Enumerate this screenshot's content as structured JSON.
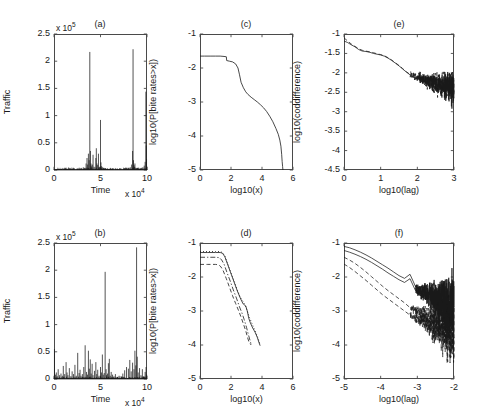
{
  "figure": {
    "name": "six-panel-network-traffic-figure",
    "background": "#ffffff",
    "axis_color": "#4a4a4a",
    "line_color": "#1a1a1a"
  },
  "chart_data": [
    {
      "id": "a",
      "type": "line",
      "title": "(a)",
      "xlabel": "Time",
      "ylabel": "Traffic",
      "x_multiplier": "x 10",
      "x_multiplier_exp": "4",
      "y_multiplier": "x 10",
      "y_multiplier_exp": "5",
      "xlim": [
        0,
        10
      ],
      "ylim": [
        0,
        2.5
      ],
      "xticks": [
        0,
        5,
        10
      ],
      "yticks": [
        0,
        0.5,
        1,
        1.5,
        2,
        2.5
      ],
      "xticklabels": [
        "0",
        "5",
        "10"
      ],
      "yticklabels": [
        "0",
        "0.5",
        "1",
        "1.5",
        "2",
        "2.5"
      ],
      "grid": false,
      "legend": "none",
      "series": [
        {
          "name": "traffic-bursty",
          "style": "solid",
          "x": [
            0.05,
            0.12,
            0.3,
            0.55,
            0.8,
            1.1,
            1.4,
            1.8,
            2.1,
            2.5,
            2.9,
            3.15,
            3.3,
            3.45,
            3.55,
            3.62,
            3.7,
            3.78,
            3.85,
            3.92,
            3.97,
            4.0,
            4.05,
            4.12,
            4.2,
            4.3,
            4.4,
            4.5,
            4.55,
            4.62,
            4.7,
            4.78,
            4.85,
            4.92,
            5.0,
            5.05,
            5.12,
            5.2,
            5.3,
            5.45,
            5.6,
            5.8,
            6.0,
            6.3,
            6.6,
            6.9,
            7.2,
            7.5,
            7.8,
            8.0,
            8.2,
            8.35,
            8.45,
            8.5,
            8.55,
            8.6,
            8.65,
            8.7,
            8.8,
            8.9,
            9.0,
            9.2,
            9.4,
            9.55,
            9.7,
            9.8,
            9.88,
            9.92,
            9.95,
            9.98
          ],
          "y": [
            0.02,
            0.01,
            0.015,
            0.02,
            0.01,
            0.015,
            0.02,
            0.01,
            0.015,
            0.02,
            0.03,
            0.05,
            0.04,
            0.12,
            0.22,
            0.1,
            0.3,
            0.18,
            2.17,
            0.35,
            0.12,
            0.08,
            0.05,
            0.1,
            0.28,
            0.06,
            0.05,
            0.22,
            0.4,
            0.12,
            0.09,
            0.3,
            0.05,
            0.06,
            0.92,
            0.14,
            0.07,
            0.05,
            0.04,
            0.03,
            0.02,
            0.015,
            0.02,
            0.03,
            0.02,
            0.015,
            0.03,
            0.02,
            0.04,
            0.03,
            0.05,
            0.1,
            0.35,
            2.22,
            0.18,
            0.09,
            0.06,
            0.12,
            0.04,
            0.03,
            0.02,
            0.02,
            0.03,
            0.05,
            0.08,
            0.15,
            1.44,
            0.45,
            0.2,
            0.06
          ]
        }
      ]
    },
    {
      "id": "b",
      "type": "line",
      "title": "(b)",
      "xlabel": "Time",
      "ylabel": "Traffic",
      "x_multiplier": "x 10",
      "x_multiplier_exp": "4",
      "y_multiplier": "x 10",
      "y_multiplier_exp": "5",
      "xlim": [
        0,
        10
      ],
      "ylim": [
        0,
        2.5
      ],
      "xticks": [
        0,
        5,
        10
      ],
      "yticks": [
        0,
        0.5,
        1,
        1.5,
        2,
        2.5
      ],
      "xticklabels": [
        "0",
        "5",
        "10"
      ],
      "yticklabels": [
        "0",
        "0.5",
        "1",
        "1.5",
        "2",
        "2.5"
      ],
      "grid": false,
      "legend": "none",
      "series": [
        {
          "name": "traffic-distributed",
          "style": "solid",
          "x": [
            0.05,
            0.15,
            0.25,
            0.35,
            0.45,
            0.6,
            0.75,
            0.9,
            1.0,
            1.15,
            1.3,
            1.4,
            1.5,
            1.65,
            1.8,
            1.95,
            2.1,
            2.25,
            2.4,
            2.55,
            2.7,
            2.8,
            2.9,
            3.05,
            3.2,
            3.35,
            3.5,
            3.6,
            3.7,
            3.8,
            3.9,
            4.0,
            4.1,
            4.2,
            4.35,
            4.5,
            4.6,
            4.7,
            4.85,
            5.0,
            5.1,
            5.2,
            5.3,
            5.4,
            5.5,
            5.6,
            5.65,
            5.75,
            5.85,
            5.95,
            6.05,
            6.15,
            6.3,
            6.45,
            6.6,
            6.8,
            7.0,
            7.2,
            7.4,
            7.6,
            7.8,
            8.0,
            8.15,
            8.3,
            8.45,
            8.6,
            8.7,
            8.8,
            8.88,
            8.95,
            9.05,
            9.2,
            9.35,
            9.5,
            9.65,
            9.8,
            9.9,
            9.96
          ],
          "y": [
            0.55,
            0.08,
            0.12,
            0.05,
            0.18,
            0.07,
            0.1,
            0.06,
            0.24,
            0.09,
            0.31,
            0.12,
            0.07,
            0.2,
            0.05,
            0.14,
            0.09,
            0.26,
            0.06,
            0.48,
            0.11,
            0.17,
            0.06,
            0.09,
            0.22,
            0.62,
            0.13,
            0.08,
            0.52,
            0.19,
            0.36,
            0.1,
            0.28,
            0.07,
            0.15,
            0.31,
            0.09,
            0.17,
            0.06,
            0.22,
            0.12,
            0.45,
            0.08,
            0.11,
            1.97,
            0.18,
            0.07,
            0.1,
            0.29,
            0.37,
            0.06,
            0.13,
            0.08,
            0.05,
            0.09,
            0.04,
            0.06,
            0.05,
            0.1,
            0.16,
            0.22,
            0.19,
            0.35,
            0.14,
            0.3,
            0.18,
            0.52,
            0.25,
            2.42,
            0.41,
            0.12,
            0.2,
            0.07,
            0.18,
            0.05,
            0.13,
            0.22,
            0.08
          ]
        }
      ]
    },
    {
      "id": "c",
      "type": "line",
      "title": "(c)",
      "xlabel": "log10(x)",
      "ylabel": "log10(P[bite rates>x])",
      "xlim": [
        0,
        6
      ],
      "ylim": [
        -5,
        -1
      ],
      "xticks": [
        0,
        2,
        4,
        6
      ],
      "yticks": [
        -5,
        -4,
        -3,
        -2,
        -1
      ],
      "xticklabels": [
        "0",
        "2",
        "4",
        "6"
      ],
      "yticklabels": [
        "-5",
        "-4",
        "-3",
        "-2",
        "-1"
      ],
      "grid": false,
      "legend": "none",
      "series": [
        {
          "name": "ccdf-aggregate",
          "style": "solid",
          "x": [
            0,
            0.3,
            0.7,
            1.0,
            1.3,
            1.55,
            1.7,
            1.72,
            1.9,
            2.1,
            2.3,
            2.45,
            2.55,
            2.65,
            2.8,
            2.95,
            3.1,
            3.3,
            3.5,
            3.7,
            3.9,
            4.1,
            4.3,
            4.5,
            4.7,
            4.9,
            5.05,
            5.15,
            5.22,
            5.27,
            5.3,
            5.33,
            5.35
          ],
          "y": [
            -1.65,
            -1.65,
            -1.65,
            -1.65,
            -1.65,
            -1.66,
            -1.67,
            -1.78,
            -1.8,
            -1.82,
            -1.88,
            -2.0,
            -2.2,
            -2.42,
            -2.58,
            -2.7,
            -2.78,
            -2.86,
            -2.93,
            -3.0,
            -3.08,
            -3.17,
            -3.28,
            -3.42,
            -3.58,
            -3.78,
            -3.95,
            -4.12,
            -4.3,
            -4.55,
            -4.75,
            -4.9,
            -5.0
          ]
        }
      ]
    },
    {
      "id": "d",
      "type": "line",
      "title": "(d)",
      "xlabel": "log10(x)",
      "ylabel": "log10(P[bite rates>x])",
      "xlim": [
        0,
        6
      ],
      "ylim": [
        -5,
        -1
      ],
      "xticks": [
        0,
        2,
        4,
        6
      ],
      "yticks": [
        -5,
        -4,
        -3,
        -2,
        -1
      ],
      "xticklabels": [
        "0",
        "2",
        "4",
        "6"
      ],
      "yticklabels": [
        "-5",
        "-4",
        "-3",
        "-2",
        "-1"
      ],
      "grid": false,
      "legend": "none",
      "series": [
        {
          "name": "ccdf-solid",
          "style": "solid",
          "x": [
            0,
            0.5,
            1.0,
            1.3,
            1.45,
            1.6,
            1.8,
            2.0,
            2.2,
            2.4,
            2.6,
            2.7,
            2.8,
            2.95,
            3.05,
            3.15,
            3.25,
            3.4,
            3.55,
            3.7,
            3.8,
            3.88
          ],
          "y": [
            -1.28,
            -1.28,
            -1.28,
            -1.28,
            -1.3,
            -1.4,
            -1.65,
            -1.9,
            -2.15,
            -2.4,
            -2.62,
            -2.72,
            -2.8,
            -2.85,
            -3.0,
            -3.22,
            -3.35,
            -3.5,
            -3.62,
            -3.78,
            -3.92,
            -4.02
          ]
        },
        {
          "name": "ccdf-dotted",
          "style": "dotted",
          "x": [
            0,
            0.5,
            1.0,
            1.3,
            1.45,
            1.6,
            1.8,
            2.0,
            2.2,
            2.4,
            2.6,
            2.75,
            2.9,
            3.05,
            3.2,
            3.4,
            3.55,
            3.7,
            3.85
          ],
          "y": [
            -1.25,
            -1.25,
            -1.25,
            -1.25,
            -1.28,
            -1.38,
            -1.62,
            -1.88,
            -2.12,
            -2.38,
            -2.6,
            -2.7,
            -2.82,
            -3.0,
            -3.2,
            -3.42,
            -3.58,
            -3.75,
            -3.95
          ]
        },
        {
          "name": "ccdf-dashdot",
          "style": "dashdot",
          "x": [
            0,
            0.5,
            1.0,
            1.25,
            1.4,
            1.55,
            1.75,
            1.95,
            2.15,
            2.35,
            2.55,
            2.7,
            2.85,
            3.0,
            3.1,
            3.2,
            3.3
          ],
          "y": [
            -1.42,
            -1.42,
            -1.42,
            -1.43,
            -1.5,
            -1.62,
            -1.88,
            -2.12,
            -2.38,
            -2.62,
            -2.88,
            -3.05,
            -3.25,
            -3.48,
            -3.66,
            -3.82,
            -3.98
          ]
        },
        {
          "name": "ccdf-dashed",
          "style": "dashed",
          "x": [
            0,
            0.5,
            1.0,
            1.2,
            1.35,
            1.5,
            1.7,
            1.9,
            2.1,
            2.3,
            2.5,
            2.65,
            2.8,
            2.95,
            3.05,
            3.15,
            3.3
          ],
          "y": [
            -1.63,
            -1.63,
            -1.63,
            -1.64,
            -1.7,
            -1.82,
            -2.05,
            -2.3,
            -2.55,
            -2.78,
            -3.0,
            -3.18,
            -3.38,
            -3.58,
            -3.75,
            -3.9,
            -4.0
          ]
        }
      ]
    },
    {
      "id": "e",
      "type": "line",
      "title": "(e)",
      "xlabel": "log10(lag)",
      "ylabel": "log10(coddifference)",
      "xlim": [
        0,
        3
      ],
      "ylim": [
        -4.5,
        -1
      ],
      "xticks": [
        0,
        1,
        2,
        3
      ],
      "yticks": [
        -4.5,
        -4,
        -3.5,
        -3,
        -2.5,
        -2,
        -1.5,
        -1
      ],
      "xticklabels": [
        "0",
        "1",
        "2",
        "3"
      ],
      "yticklabels": [
        "-4.5",
        "-4",
        "-3.5",
        "-3",
        "-2.5",
        "-2",
        "-1.5",
        "-1"
      ],
      "grid": false,
      "legend": "none",
      "series": [
        {
          "name": "coddiff-solid",
          "style": "solid",
          "noise_start_x": 1.75,
          "x": [
            0,
            0.1,
            0.2,
            0.3,
            0.4,
            0.5,
            0.6,
            0.7,
            0.8,
            0.9,
            1.0,
            1.1,
            1.2,
            1.3,
            1.4,
            1.5,
            1.6,
            1.7,
            1.8,
            1.9,
            2.0
          ],
          "y": [
            -1.18,
            -1.22,
            -1.28,
            -1.33,
            -1.4,
            -1.44,
            -1.45,
            -1.47,
            -1.5,
            -1.52,
            -1.54,
            -1.57,
            -1.62,
            -1.68,
            -1.75,
            -1.82,
            -1.9,
            -1.98,
            -2.05,
            -2.1,
            -2.12
          ]
        },
        {
          "name": "coddiff-dashed",
          "style": "dashed",
          "x": [
            0,
            0.1,
            0.2,
            0.3,
            0.4,
            0.5,
            0.6,
            0.7,
            0.8,
            0.9,
            1.0,
            1.1,
            1.2,
            1.3,
            1.4,
            1.5,
            1.6,
            1.7,
            1.8
          ],
          "y": [
            -1.1,
            -1.18,
            -1.26,
            -1.32,
            -1.38,
            -1.42,
            -1.44,
            -1.46,
            -1.48,
            -1.51,
            -1.53,
            -1.56,
            -1.61,
            -1.67,
            -1.74,
            -1.81,
            -1.89,
            -1.97,
            -2.04
          ]
        }
      ]
    },
    {
      "id": "f",
      "type": "line",
      "title": "(f)",
      "xlabel": "log10(lag)",
      "ylabel": "log10(coddifference)",
      "xlim": [
        0,
        3
      ],
      "ylim": [
        -5,
        -1
      ],
      "xticks": [
        0,
        1,
        2,
        3
      ],
      "yticks": [
        -5,
        -4,
        -3,
        -2,
        -1
      ],
      "xticklabels": [
        "-5",
        "-4",
        "-3",
        "-2",
        "-1"
      ],
      "yticklabels": [
        "-5",
        "-4",
        "-3",
        "-2",
        "-1"
      ],
      "grid": false,
      "legend": "none",
      "series": [
        {
          "name": "coddiff-solid-1",
          "style": "solid",
          "x": [
            0,
            0.15,
            0.3,
            0.45,
            0.6,
            0.75,
            0.9,
            1.05,
            1.2,
            1.35,
            1.5,
            1.65,
            1.8,
            1.95
          ],
          "y": [
            -1.1,
            -1.14,
            -1.2,
            -1.27,
            -1.35,
            -1.44,
            -1.54,
            -1.64,
            -1.74,
            -1.85,
            -1.96,
            -2.04,
            -1.92,
            -2.28
          ]
        },
        {
          "name": "coddiff-solid-2",
          "style": "solid",
          "x": [
            0,
            0.15,
            0.3,
            0.45,
            0.6,
            0.75,
            0.9,
            1.05,
            1.2,
            1.35,
            1.5,
            1.65,
            1.8,
            1.95
          ],
          "y": [
            -1.22,
            -1.27,
            -1.33,
            -1.4,
            -1.48,
            -1.57,
            -1.67,
            -1.77,
            -1.88,
            -1.98,
            -2.08,
            -2.16,
            -2.05,
            -2.4
          ]
        },
        {
          "name": "coddiff-dashed-1",
          "style": "dashed",
          "x": [
            0,
            0.15,
            0.3,
            0.45,
            0.6,
            0.75,
            0.9,
            1.05,
            1.2,
            1.35,
            1.5,
            1.65,
            1.8
          ],
          "y": [
            -1.42,
            -1.5,
            -1.6,
            -1.72,
            -1.85,
            -1.99,
            -2.13,
            -2.27,
            -2.4,
            -2.52,
            -2.64,
            -2.76,
            -2.9
          ]
        },
        {
          "name": "coddiff-dashed-2",
          "style": "dashed",
          "x": [
            0,
            0.15,
            0.3,
            0.45,
            0.6,
            0.75,
            0.9,
            1.05,
            1.2,
            1.35,
            1.5,
            1.65,
            1.8
          ],
          "y": [
            -1.62,
            -1.72,
            -1.84,
            -1.97,
            -2.1,
            -2.24,
            -2.38,
            -2.52,
            -2.64,
            -2.76,
            -2.88,
            -3.0,
            -3.12
          ]
        }
      ]
    }
  ]
}
